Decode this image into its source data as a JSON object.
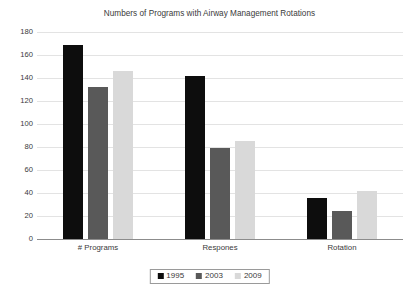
{
  "chart_data": {
    "type": "bar",
    "title": "Numbers of Programs with Airway Management Rotations",
    "xlabel": "",
    "ylabel": "",
    "categories": [
      "# Programs",
      "Respones",
      "Rotation"
    ],
    "series": [
      {
        "name": "1995",
        "color": "#0d0d0d",
        "values": [
          169,
          142,
          36
        ]
      },
      {
        "name": "2003",
        "color": "#595959",
        "values": [
          132,
          79,
          24
        ]
      },
      {
        "name": "2009",
        "color": "#d9d9d9",
        "values": [
          146,
          85,
          42
        ]
      }
    ],
    "ylim": [
      0,
      180
    ],
    "yticks": [
      0,
      20,
      40,
      60,
      80,
      100,
      120,
      140,
      160,
      180
    ],
    "ytick_labels": [
      "0",
      "20",
      "40",
      "60",
      "80",
      "100",
      "120",
      "140",
      "160",
      "180"
    ],
    "grid": true,
    "grid_color": "#e3e3e3",
    "axis_color": "#8c8c8c",
    "legend": {
      "position": "bottom-center",
      "bordered": true,
      "entries": [
        {
          "label": "1995",
          "color": "#0d0d0d"
        },
        {
          "label": "2003",
          "color": "#595959"
        },
        {
          "label": "2009",
          "color": "#d9d9d9"
        }
      ]
    },
    "background": "#ffffff"
  }
}
